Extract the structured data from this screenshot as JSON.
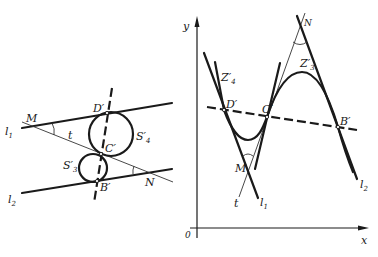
{
  "left_figure": {
    "labels": {
      "l1": "l",
      "l1_sub": "1",
      "l2": "l",
      "l2_sub": "2",
      "M": "M",
      "N": "N",
      "t": "t",
      "D": "D′",
      "C": "C′",
      "B": "B′",
      "S4": "S′",
      "S4_sub": "4",
      "S3": "S′",
      "S3_sub": "3"
    }
  },
  "right_figure": {
    "axes": {
      "y": "y",
      "x": "x",
      "origin": "0"
    },
    "labels": {
      "Z4": "Z′",
      "Z4_sub": "4",
      "Z3": "Z′",
      "Z3_sub": "3",
      "D": "D′",
      "C": "C′",
      "B": "B′",
      "M": "M",
      "N": "N",
      "t": "t",
      "l1": "l",
      "l1_sub": "1",
      "l2": "l",
      "l2_sub": "2"
    }
  }
}
